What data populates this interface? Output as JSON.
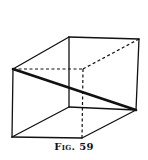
{
  "figure": {
    "caption": "Fig. 59",
    "stroke_color": "#111111",
    "vertices": {
      "front_top_left": [
        13,
        69
      ],
      "front_bottom_left": [
        12,
        137
      ],
      "front_bottom_right": [
        82,
        138
      ],
      "front_top_right": [
        83,
        69
      ],
      "back_top_left": [
        69,
        37
      ],
      "back_top_right": [
        139,
        39
      ],
      "back_bottom_right": [
        136,
        110
      ],
      "back_bottom_left": [
        69,
        107
      ]
    },
    "edges": {
      "solid": [
        [
          "front_top_left",
          "front_bottom_left"
        ],
        [
          "front_bottom_left",
          "front_bottom_right"
        ],
        [
          "front_top_left",
          "back_top_left"
        ],
        [
          "back_top_left",
          "back_top_right"
        ],
        [
          "back_top_right",
          "back_bottom_right"
        ],
        [
          "back_top_left",
          "back_bottom_left"
        ],
        [
          "back_bottom_left",
          "back_bottom_right"
        ],
        [
          "front_bottom_left",
          "back_bottom_left"
        ],
        [
          "front_bottom_right",
          "back_bottom_right"
        ]
      ],
      "dashed": [
        [
          "front_top_left",
          "front_top_right"
        ],
        [
          "front_top_right",
          "back_top_right"
        ],
        [
          "front_top_right",
          "front_bottom_right"
        ]
      ],
      "bold_diagonal": [
        "front_top_left",
        "back_bottom_right"
      ]
    }
  }
}
